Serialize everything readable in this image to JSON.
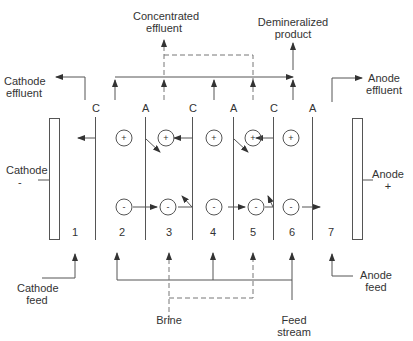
{
  "diagram": {
    "labels": {
      "concentrated_effluent": [
        "Concentrated",
        "effluent"
      ],
      "demineralized_product": [
        "Demineralized",
        "product"
      ],
      "cathode_effluent": [
        "Cathode",
        "effluent"
      ],
      "anode_effluent": [
        "Anode",
        "effluent"
      ],
      "cathode": [
        "Cathode",
        "-"
      ],
      "anode": [
        "Anode",
        "+"
      ],
      "cathode_feed": [
        "Cathode",
        "feed"
      ],
      "anode_feed": [
        "Anode",
        "feed"
      ],
      "brine": "Brine",
      "feed_stream": [
        "Feed",
        "stream"
      ]
    },
    "membranes": [
      {
        "type": "C",
        "x": 95
      },
      {
        "type": "A",
        "x": 145
      },
      {
        "type": "C",
        "x": 192
      },
      {
        "type": "A",
        "x": 233
      },
      {
        "type": "C",
        "x": 273
      },
      {
        "type": "A",
        "x": 312
      }
    ],
    "compartments": [
      "1",
      "2",
      "3",
      "4",
      "5",
      "6",
      "7"
    ],
    "cations_symbol": "+",
    "anions_symbol": "-",
    "line_color": "#555555",
    "dash_color": "#777777"
  }
}
